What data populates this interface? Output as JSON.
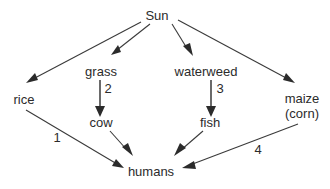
{
  "diagram": {
    "type": "food-web-flow-diagram",
    "background_color": "#ffffff",
    "line_color": "#3a3a3a",
    "text_color": "#2b2b2b",
    "nodes": [
      {
        "id": "sun",
        "label": "Sun",
        "x": 157,
        "y": 16
      },
      {
        "id": "rice",
        "label": "rice",
        "x": 24,
        "y": 101
      },
      {
        "id": "grass",
        "label": "grass",
        "x": 101,
        "y": 73
      },
      {
        "id": "waterweed",
        "label": "waterweed",
        "x": 206,
        "y": 73
      },
      {
        "id": "maize",
        "label": "maize",
        "x": 302,
        "y": 100
      },
      {
        "id": "maize_alt",
        "label": "(corn)",
        "x": 302,
        "y": 115
      },
      {
        "id": "cow",
        "label": "cow",
        "x": 101,
        "y": 124
      },
      {
        "id": "fish",
        "label": "fish",
        "x": 210,
        "y": 124
      },
      {
        "id": "humans",
        "label": "humans",
        "x": 151,
        "y": 173
      }
    ],
    "edges": [
      {
        "id": "sun-rice",
        "from": "Sun",
        "to": "rice",
        "label": ""
      },
      {
        "id": "sun-grass",
        "from": "Sun",
        "to": "grass",
        "label": ""
      },
      {
        "id": "sun-waterweed",
        "from": "Sun",
        "to": "waterweed",
        "label": ""
      },
      {
        "id": "sun-maize",
        "from": "Sun",
        "to": "maize",
        "label": ""
      },
      {
        "id": "rice-humans",
        "from": "rice",
        "to": "humans",
        "label": "1"
      },
      {
        "id": "grass-cow",
        "from": "grass",
        "to": "cow",
        "label": "2"
      },
      {
        "id": "waterweed-fish",
        "from": "waterweed",
        "to": "fish",
        "label": "3"
      },
      {
        "id": "maize-humans",
        "from": "maize",
        "to": "humans",
        "label": "4"
      },
      {
        "id": "cow-humans",
        "from": "cow",
        "to": "humans",
        "label": ""
      },
      {
        "id": "fish-humans",
        "from": "fish",
        "to": "humans",
        "label": ""
      }
    ],
    "edge_labels": {
      "one": {
        "text": "1",
        "x": 57,
        "y": 139
      },
      "two": {
        "text": "2",
        "x": 108,
        "y": 90
      },
      "three": {
        "text": "3",
        "x": 220,
        "y": 90
      },
      "four": {
        "text": "4",
        "x": 258,
        "y": 151
      }
    }
  }
}
